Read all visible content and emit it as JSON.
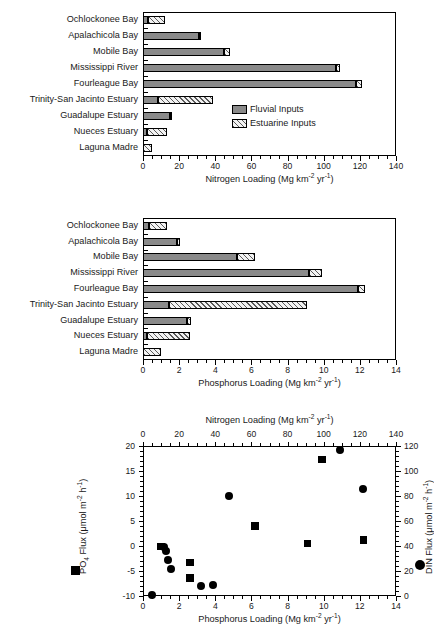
{
  "figure": {
    "categories": [
      "Ochlockonee Bay",
      "Apalachicola Bay",
      "Mobile Bay",
      "Mississippi River",
      "Fourleague  Bay",
      "Trinity-San Jacinto Estuary",
      "Guadalupe Estuary",
      "Nueces Estuary",
      "Laguna Madre"
    ],
    "legend": {
      "fluvial_label": "Fluvial Inputs",
      "estuarine_label": "Estuarine Inputs",
      "fluvial_color": "#8a8a8a",
      "estuarine_color": "#f2f2f2"
    }
  },
  "chart_data": [
    {
      "type": "bar",
      "panel": "top",
      "orientation": "horizontal",
      "stacked": true,
      "title": "",
      "xlabel": "Nitrogen Loading (Mg km-2 yr-1)",
      "xlabel_parts": {
        "pre": "Nitrogen Loading (Mg km",
        "sup1": "-2",
        "mid": " yr",
        "sup2": "-1",
        "post": ")"
      },
      "ylabel": "",
      "xlim": [
        0,
        140
      ],
      "xticks": [
        0,
        20,
        40,
        60,
        80,
        100,
        120,
        140
      ],
      "xtick_labels": [
        "0",
        "20",
        "40",
        "60",
        "80",
        "100",
        "120",
        "140"
      ],
      "minor_tick_step": 5,
      "grid": false,
      "categories": [
        "Ochlockonee Bay",
        "Apalachicola Bay",
        "Mobile Bay",
        "Mississippi River",
        "Fourleague  Bay",
        "Trinity-San Jacinto Estuary",
        "Guadalupe Estuary",
        "Nueces Estuary",
        "Laguna Madre"
      ],
      "series": [
        {
          "name": "Fluvial Inputs",
          "values": [
            2.6,
            31.0,
            45.0,
            107.0,
            118.0,
            8.5,
            15.0,
            2.2,
            0.0
          ]
        },
        {
          "name": "Estuarine Inputs",
          "values": [
            9.6,
            1.3,
            3.0,
            2.0,
            3.0,
            30.5,
            0.6,
            11.3,
            5.2
          ]
        }
      ],
      "totals": [
        12.2,
        32.3,
        48.0,
        109.0,
        121.0,
        39.0,
        15.6,
        13.5,
        5.2
      ]
    },
    {
      "type": "bar",
      "panel": "middle",
      "orientation": "horizontal",
      "stacked": true,
      "title": "",
      "xlabel": "Phosphorus Loading (Mg km-2 yr-1)",
      "xlabel_parts": {
        "pre": "Phosphorus Loading (Mg km",
        "sup1": "-2",
        "mid": " yr",
        "sup2": "-1",
        "post": ")"
      },
      "ylabel": "",
      "xlim": [
        0,
        14
      ],
      "xticks": [
        0,
        2,
        4,
        6,
        8,
        10,
        12,
        14
      ],
      "xtick_labels": [
        "0",
        "2",
        "4",
        "6",
        "8",
        "10",
        "12",
        "14"
      ],
      "minor_tick_step": 0.5,
      "grid": false,
      "categories": [
        "Ochlockonee Bay",
        "Apalachicola Bay",
        "Mobile Bay",
        "Mississippi River",
        "Fourleague  Bay",
        "Trinity-San Jacinto Estuary",
        "Guadalupe Estuary",
        "Nueces Estuary",
        "Laguna Madre"
      ],
      "series": [
        {
          "name": "Fluvial Inputs",
          "values": [
            0.35,
            1.9,
            5.2,
            9.2,
            11.9,
            1.45,
            2.45,
            0.2,
            0.0
          ]
        },
        {
          "name": "Estuarine Inputs",
          "values": [
            1.0,
            0.15,
            1.0,
            0.7,
            0.4,
            7.65,
            0.2,
            2.4,
            1.0
          ]
        }
      ],
      "totals": [
        1.35,
        2.05,
        6.2,
        9.9,
        12.3,
        9.1,
        2.65,
        2.6,
        1.0
      ]
    },
    {
      "type": "scatter",
      "panel": "bottom",
      "title": "",
      "xlabel": "Phosphorus Loading (Mg km-2 yr-1)",
      "xlabel_parts": {
        "pre": "Phosphorus Loading (Mg km",
        "sup1": "-2",
        "mid": " yr",
        "sup2": "-1",
        "post": ")"
      },
      "xlabel_top": "Nitrogen Loading (Mg km-2 yr-1)",
      "xlabel_top_parts": {
        "pre": "Nitrogen Loading (Mg km",
        "sup1": "-2",
        "mid": " yr",
        "sup2": "-1",
        "post": ")"
      },
      "ylabel_left": "PO4 Flux (umol m-2 h-1)",
      "ylabel_left_parts": {
        "pre": "PO",
        "sub": "4",
        "mid": " Flux (μmol  m",
        "sup1": "-2",
        "mid2": " h",
        "sup2": "-1",
        "post": ")"
      },
      "ylabel_right": "DIN Flux (umol m-2 h-1)",
      "ylabel_right_parts": {
        "pre": "DIN Flux (μmol m",
        "sup1": "-2",
        "mid": " h",
        "sup2": "-1",
        "post": ")"
      },
      "xlim": [
        0,
        14
      ],
      "xticks": [
        0,
        2,
        4,
        6,
        8,
        10,
        12,
        14
      ],
      "xtick_labels": [
        "0",
        "2",
        "4",
        "6",
        "8",
        "10",
        "12",
        "14"
      ],
      "xlim_top": [
        0,
        140
      ],
      "xticks_top": [
        0,
        20,
        40,
        60,
        80,
        100,
        120,
        140
      ],
      "xtick_labels_top": [
        "0",
        "20",
        "40",
        "60",
        "80",
        "100",
        "120",
        "140"
      ],
      "ylim_left": [
        -10,
        20
      ],
      "yticks_left": [
        -10,
        -5,
        0,
        5,
        10,
        15,
        20
      ],
      "ytick_labels_left": [
        "-10",
        "-5",
        "0",
        "5",
        "10",
        "15",
        "20"
      ],
      "ylim_right": [
        0,
        120
      ],
      "yticks_right": [
        0,
        20,
        40,
        60,
        80,
        100,
        120
      ],
      "ytick_labels_right": [
        "0",
        "20",
        "40",
        "60",
        "80",
        "100",
        "120"
      ],
      "grid": false,
      "series": [
        {
          "name": "PO4 Flux",
          "marker": "square",
          "axis": "left",
          "points": [
            {
              "x": 1.0,
              "y": -0.1
            },
            {
              "x": 2.6,
              "y": -3.3
            },
            {
              "x": 2.6,
              "y": -6.4
            },
            {
              "x": 6.2,
              "y": 4.0
            },
            {
              "x": 9.1,
              "y": 0.5
            },
            {
              "x": 9.9,
              "y": 17.3
            },
            {
              "x": 12.2,
              "y": 1.2
            }
          ]
        },
        {
          "name": "DIN Flux",
          "marker": "circle",
          "axis": "right",
          "points": [
            {
              "x": 0.5,
              "y": 1.0
            },
            {
              "x": 1.15,
              "y": 39.5
            },
            {
              "x": 1.3,
              "y": 36.0
            },
            {
              "x": 1.4,
              "y": 28.5
            },
            {
              "x": 1.55,
              "y": 21.5
            },
            {
              "x": 3.2,
              "y": 8.0
            },
            {
              "x": 3.9,
              "y": 8.5
            },
            {
              "x": 4.75,
              "y": 80.0
            },
            {
              "x": 10.9,
              "y": 117.0
            },
            {
              "x": 12.2,
              "y": 86.0
            }
          ]
        }
      ],
      "legend_markers": [
        {
          "symbol": "square",
          "label_axis": "left"
        },
        {
          "symbol": "circle",
          "label_axis": "right"
        }
      ]
    }
  ]
}
